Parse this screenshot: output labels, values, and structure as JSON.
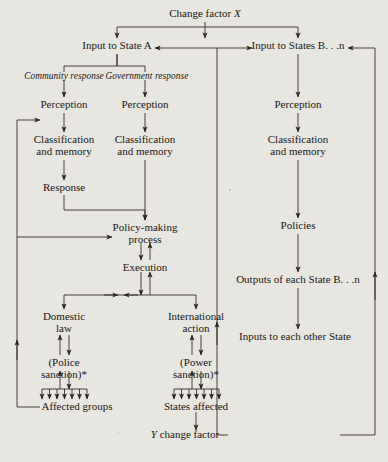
{
  "figure": {
    "type": "flowchart",
    "paper_color": "#e8e6e0",
    "ink_color": "#1a1714",
    "footnote_marker": "*"
  },
  "nodes": {
    "change_factor_x": "Change factor X",
    "input_state_a": "Input to State A",
    "input_states_bn": "Input to States B. . .n",
    "community_response": "Community response",
    "government_response": "Government response",
    "perception_left": "Perception",
    "perception_mid": "Perception",
    "perception_right": "Perception",
    "classification_left_1": "Classification",
    "classification_left_2": "and memory",
    "classification_mid_1": "Classification",
    "classification_mid_2": "and memory",
    "classification_right_1": "Classification",
    "classification_right_2": "and memory",
    "response": "Response",
    "policy_making_1": "Policy-making",
    "policy_making_2": "process",
    "execution": "Execution",
    "policies": "Policies",
    "outputs_each_state": "Outputs of each State B. . .n",
    "inputs_each_other_state": "Inputs to each other State",
    "domestic_law_1": "Domestic",
    "domestic_law_2": "law",
    "international_action_1": "International",
    "international_action_2": "action",
    "police_sanction_1": "(Police",
    "police_sanction_2": "sanction)*",
    "power_sanction_1": "(Power",
    "power_sanction_2": "sanction)*",
    "affected_groups": "Affected groups",
    "states_affected": "States affected",
    "y_change_factor": "Y change factor"
  },
  "columns": {
    "left_label": "Community response",
    "middle_label": "Government response",
    "right_label": "States B. . .n"
  },
  "fan_teeth": {
    "affected_groups_count": 7,
    "states_affected_count": 7
  }
}
